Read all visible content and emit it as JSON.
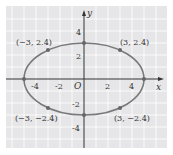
{
  "diagram": {
    "type": "ellipse-graph",
    "axes": {
      "x_label": "x",
      "y_label": "y",
      "origin_label": "O"
    },
    "x_ticks": [
      "-4",
      "-2",
      "2",
      "4"
    ],
    "y_ticks": [
      "4",
      "2",
      "-2",
      "-4"
    ],
    "points": [
      {
        "label": "(−3, 2.4)",
        "x": -3,
        "y": 2.4
      },
      {
        "label": "(3, 2.4)",
        "x": 3,
        "y": 2.4
      },
      {
        "label": "(−3, −2.4)",
        "x": -3,
        "y": -2.4
      },
      {
        "label": "(3, −2.4)",
        "x": 3,
        "y": -2.4
      }
    ],
    "ellipse": {
      "a": 5,
      "b": 3
    },
    "colors": {
      "grid_bg": "#e8e8ea",
      "grid_line": "#ffffff",
      "curve": "#7a7a7a",
      "axis": "#333333"
    }
  }
}
